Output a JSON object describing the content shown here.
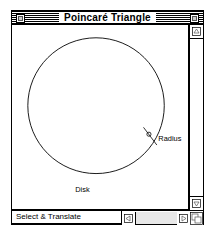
{
  "window": {
    "title": "Poincaré Triangle",
    "close_box_name": "close-box",
    "zoom_box_name": "zoom-box"
  },
  "canvas": {
    "labels": {
      "disk": "Disk",
      "radius": "Radius"
    }
  },
  "statusbar": {
    "mode_text": "Select & Translate"
  },
  "scrollbars": {
    "vertical": {
      "up_arrow": "▲",
      "down_arrow": "▼"
    },
    "horizontal": {
      "left_arrow": "◀",
      "right_arrow": "▶"
    }
  },
  "colors": {
    "frame": "#000000",
    "window_background": "#ffffff",
    "titlebar_stripe": "#000000",
    "scroll_track": "#e8e8e8",
    "stroke": "#000000"
  },
  "figure": {
    "type": "geometry-diagram",
    "circle": {
      "cx": 85,
      "cy": 82,
      "r": 69
    },
    "handle_point": {
      "x": 143,
      "y": 120
    },
    "radius_leader": {
      "x1": 137,
      "y1": 112,
      "x2": 150,
      "y2": 128
    }
  }
}
